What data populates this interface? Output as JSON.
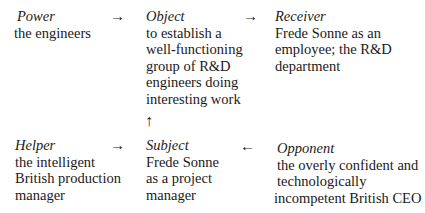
{
  "diagram": {
    "type": "actantial-model",
    "actants": {
      "power": {
        "label": "Power",
        "lines": [
          "the engineers"
        ]
      },
      "object": {
        "label": "Object",
        "lines": [
          "to establish a",
          "well-functioning",
          "group of R&D",
          "engineers doing",
          "interesting work"
        ]
      },
      "receiver": {
        "label": "Receiver",
        "lines": [
          "Frede Sonne as an",
          "employee; the R&D",
          "department"
        ]
      },
      "helper": {
        "label": "Helper",
        "lines": [
          "the intelligent",
          "British production",
          "manager"
        ]
      },
      "subject": {
        "label": "Subject",
        "lines": [
          "Frede Sonne",
          "as a project",
          "manager"
        ]
      },
      "opponent": {
        "label": "Opponent",
        "lines": [
          "the overly confident and",
          "technologically",
          "incompetent British CEO"
        ]
      }
    },
    "arrows": {
      "power_to_object": "→",
      "object_to_receiver": "→",
      "subject_to_object": "↑",
      "helper_to_subject": "→",
      "opponent_to_subject": "←"
    }
  }
}
